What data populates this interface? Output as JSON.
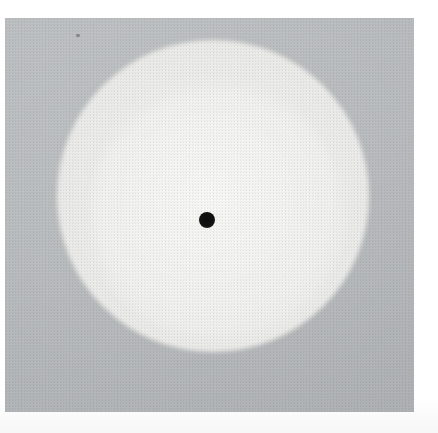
{
  "document": {
    "kind": "scanned-grayscale-plate",
    "caption": "",
    "page_background": "#ffffff"
  },
  "plate": {
    "label": "image-plate",
    "background_color": "#b9bcbe",
    "x": 5,
    "y": 18,
    "width": 409,
    "height": 394
  },
  "disc": {
    "label": "bright-circular-disc",
    "fill_color": "#eeeeec",
    "edge_color": "#dcdddd",
    "center_x": 213,
    "center_y": 196,
    "diameter": 312
  },
  "center_marker": {
    "label": "center-dot",
    "color": "#111111",
    "center_x": 207,
    "center_y": 220,
    "diameter": 16
  },
  "artifact": {
    "label": "dust-speck",
    "color": "#5a5c5f",
    "center_x": 78,
    "center_y": 35
  },
  "palette": {
    "background_gray": "#b9bcbe",
    "disc_light": "#eeeeec",
    "marker_black": "#111111",
    "margin_white": "#ffffff"
  }
}
